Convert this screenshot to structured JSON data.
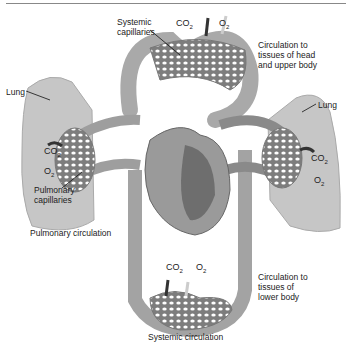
{
  "labels": {
    "systemic_capillaries": "Systemic\ncapillaries",
    "head_upper_body": "Circulation to\ntissues of head\nand upper body",
    "lung_left": "Lung",
    "lung_right": "Lung",
    "pulmonary_capillaries": "Pulmonary\ncapillaries",
    "pulmonary_circulation": "Pulmonary circulation",
    "lower_body": "Circulation to\ntissues of\nlower body",
    "systemic_circulation": "Systemic circulation"
  },
  "gases": {
    "co2": "CO",
    "o2": "O",
    "sub": "2"
  },
  "colors": {
    "oxygenated_vessel": "#b9b9b9",
    "deoxygenated_vessel": "#7a7a7a",
    "lung": "#c4c4c4",
    "capillary_bed": "#8a8a8a",
    "arrow_dark": "#3a3a3a",
    "arrow_light": "#d8d8d8"
  }
}
